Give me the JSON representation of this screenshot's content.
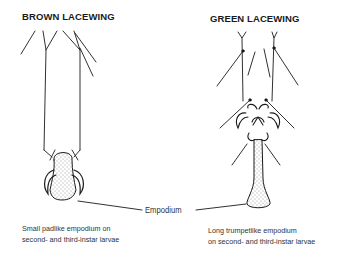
{
  "diagram": {
    "left_panel": {
      "title": "BROWN LACEWING",
      "caption_line1": "Small padlike empodium on",
      "caption_line2": "second- and third-instar larvae"
    },
    "right_panel": {
      "title": "GREEN LACEWING",
      "caption_line1": "Long trumpetlike empodium",
      "caption_line2": "on second- and third-instar larvae"
    },
    "center_label": "Empodium",
    "colors": {
      "ink": "#1a1a1a",
      "background": "#ffffff"
    }
  }
}
